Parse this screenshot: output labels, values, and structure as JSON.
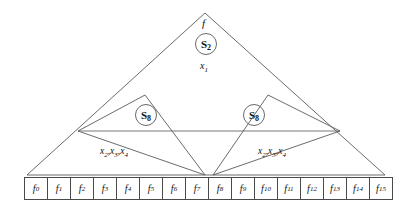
{
  "figure": {
    "type": "diagram",
    "title_label": "f",
    "apex_label": "f",
    "root_node": {
      "base": "S",
      "sub": "2",
      "text": "S2"
    },
    "root_variables": {
      "base": "x",
      "sub": "1",
      "text": "x1"
    },
    "subtrees": [
      {
        "side": "left",
        "node": {
          "base": "S",
          "sub": "8",
          "text": "S8"
        },
        "variables": "x2,x3,x4",
        "variable_parts": [
          {
            "base": "x",
            "sub": "2"
          },
          {
            "base": "x",
            "sub": "3"
          },
          {
            "base": "x",
            "sub": "4"
          }
        ]
      },
      {
        "side": "right",
        "node": {
          "base": "S",
          "sub": "8",
          "text": "S8"
        },
        "variables": "x2,x3,x4",
        "variable_parts": [
          {
            "base": "x",
            "sub": "2"
          },
          {
            "base": "x",
            "sub": "3"
          },
          {
            "base": "x",
            "sub": "4"
          }
        ]
      }
    ],
    "leaves": [
      {
        "base": "f",
        "sub": "0"
      },
      {
        "base": "f",
        "sub": "1"
      },
      {
        "base": "f",
        "sub": "2"
      },
      {
        "base": "f",
        "sub": "3"
      },
      {
        "base": "f",
        "sub": "4"
      },
      {
        "base": "f",
        "sub": "5"
      },
      {
        "base": "f",
        "sub": "6"
      },
      {
        "base": "f",
        "sub": "7"
      },
      {
        "base": "f",
        "sub": "8"
      },
      {
        "base": "f",
        "sub": "9"
      },
      {
        "base": "f",
        "sub": "10"
      },
      {
        "base": "f",
        "sub": "11"
      },
      {
        "base": "f",
        "sub": "12"
      },
      {
        "base": "f",
        "sub": "13"
      },
      {
        "base": "f",
        "sub": "14"
      },
      {
        "base": "f",
        "sub": "15"
      }
    ],
    "colors": {
      "line": "#5a5a5a",
      "text": "#111111",
      "box_border": "#4a4a4a",
      "background": "#ffffff"
    },
    "geometry": {
      "outer_triangle": "205,13 27,175 385,175",
      "horizontal_line": "78,131 340,131",
      "left_inner_triangle": "145,95 78,131 205,175",
      "right_inner_triangle": "268,95 340,131 213,175"
    }
  }
}
